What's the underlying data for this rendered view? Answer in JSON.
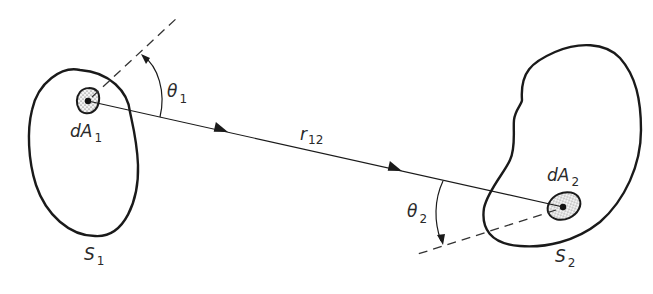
{
  "figure": {
    "colors": {
      "ink": "#1a1a1a",
      "background": "#ffffff",
      "stipple": "#e8e8e8"
    },
    "labels": {
      "surface1": {
        "main": "S",
        "sub": "1"
      },
      "surface2": {
        "main": "S",
        "sub": "2"
      },
      "element1": {
        "main": "dA",
        "sub": "1"
      },
      "element2": {
        "main": "dA",
        "sub": "2"
      },
      "distance": {
        "main": "r",
        "sub": "12"
      },
      "angle1": {
        "main": "θ",
        "sub": "1"
      },
      "angle2": {
        "main": "θ",
        "sub": "2"
      }
    },
    "geometry": {
      "element1_center": [
        88,
        101
      ],
      "element2_center": [
        563,
        207
      ],
      "normal1_end": [
        178,
        17
      ],
      "normal2_end": [
        418,
        253
      ]
    }
  }
}
